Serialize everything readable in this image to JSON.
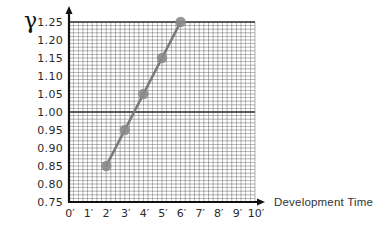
{
  "chart_data": {
    "type": "line",
    "title": "",
    "xlabel": "Development Time",
    "ylabel": "γ",
    "x": [
      2,
      3,
      4,
      5,
      6
    ],
    "series": [
      {
        "name": "gamma",
        "values": [
          0.85,
          0.95,
          1.05,
          1.15,
          1.25
        ]
      }
    ],
    "x_ticks": [
      "0′",
      "1′",
      "2′",
      "3′",
      "4′",
      "5′",
      "6′",
      "7′",
      "8′",
      "9′",
      "10′"
    ],
    "y_ticks": [
      "0.75",
      "0.80",
      "0.85",
      "0.90",
      "0.95",
      "1.00",
      "1.05",
      "1.10",
      "1.15",
      "1.20",
      "1.25"
    ],
    "xlim": [
      0,
      10
    ],
    "ylim": [
      0.75,
      1.25
    ],
    "grid": true,
    "emphasized_gridlines_y": [
      1.0,
      1.25
    ],
    "legend": "none",
    "colors": {
      "line": "#7a7a7a",
      "marker": "#8a8a8a",
      "grid": "#555555",
      "axis": "#111111"
    }
  }
}
